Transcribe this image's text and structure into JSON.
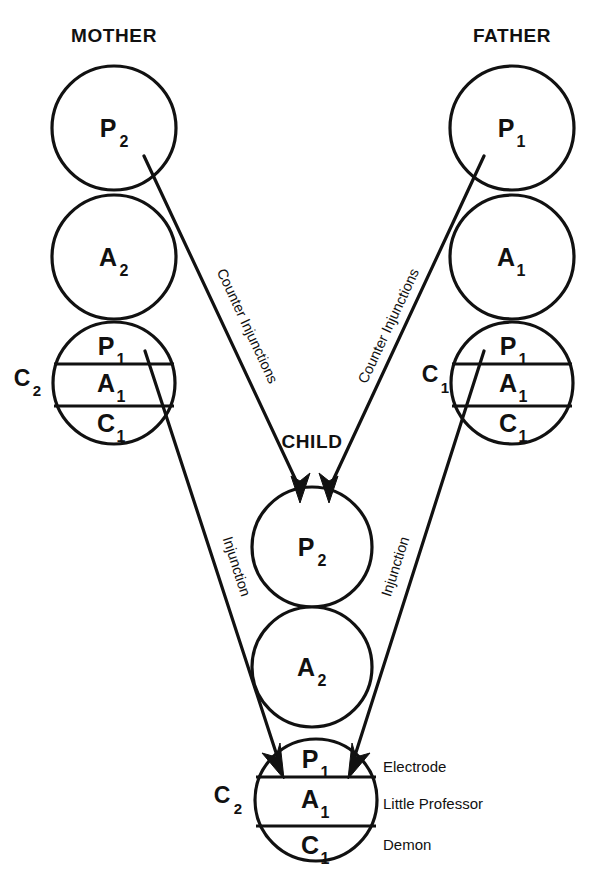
{
  "figure": {
    "title_columns": {
      "mother": "MOTHER",
      "father": "FATHER",
      "child": "CHILD"
    },
    "mother": {
      "group_label": "C",
      "group_label_sub": "2",
      "circles": [
        {
          "letter": "P",
          "sub": "2"
        },
        {
          "letter": "A",
          "sub": "2"
        }
      ],
      "segmented": [
        {
          "letter": "P",
          "sub": "1"
        },
        {
          "letter": "A",
          "sub": "1"
        },
        {
          "letter": "C",
          "sub": "1"
        }
      ]
    },
    "father": {
      "group_label": "C",
      "group_label_sub": "1",
      "circles": [
        {
          "letter": "P",
          "sub": "1"
        },
        {
          "letter": "A",
          "sub": "1"
        }
      ],
      "segmented": [
        {
          "letter": "P",
          "sub": "1"
        },
        {
          "letter": "A",
          "sub": "1"
        },
        {
          "letter": "C",
          "sub": "1"
        }
      ]
    },
    "child": {
      "group_label": "C",
      "group_label_sub": "2",
      "circles": [
        {
          "letter": "P",
          "sub": "2"
        },
        {
          "letter": "A",
          "sub": "2"
        }
      ],
      "segmented": [
        {
          "letter": "P",
          "sub": "1"
        },
        {
          "letter": "A",
          "sub": "1"
        },
        {
          "letter": "C",
          "sub": "1"
        }
      ],
      "annotations": [
        "Electrode",
        "Little Professor",
        "Demon"
      ]
    },
    "path_labels": {
      "counter_injunctions_left": "Counter Injunctions",
      "counter_injunctions_right": "Counter Injunctions",
      "injunction_left": "Injunction",
      "injunction_right": "Injunction"
    },
    "colors": {
      "ink": "#111111",
      "paper": "#ffffff"
    }
  }
}
